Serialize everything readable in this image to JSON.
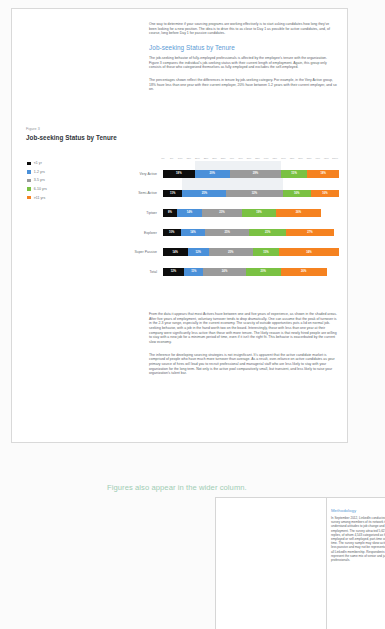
{
  "document": {
    "body_paragraphs": [
      "One way to determine if your sourcing programs are working effectively is to start asking candidates how long they've been looking for a new position. The idea is to drive this to as close to Day 1 as possible for active candidates, and, of course, long before Day 1 for passive candidates."
    ],
    "section_heading": "Job-seeking Status by Tenure",
    "section_paragraphs": [
      "The job-seeking behavior of fully-employed professionals is affected by the employee's tenure with the organization. Figure 3 compares the individual's job-seeking status with their current length of employment. Again, this group only consists of those who categorized themselves as fully employed and excludes the self-employed.",
      "The percentages shown reflect the differences in tenure by job-seeking category. For example, in the Very Active group, 18% have less than one year with their current employer, 20% have between 1-2 years with their current employer, and so on."
    ],
    "after_figure_paragraphs": [
      "From the data it appears that most Actives have between one and five years of experience, as shown in the shaded areas. After five years of employment, voluntary turnover tends to drop dramatically. One can assume that the peak of turnover is in the 2-3 year range, especially in the current economy. The scarcity of outside opportunities puts a lid on normal job-seeking behavior, with a job in the hand worth two on the board. Interestingly, those with less than one year at their company were significantly less active than those with more tenure. The likely reason is that newly hired people are willing to stay with a new job for a minimum period of time, even if it isn't the right fit. This behavior is exacerbated by the current slow economy.",
      "The inference for developing sourcing strategies is not insignificant. It's apparent that the active candidate market is comprised of people who have much more turnover than average. As a result, over-reliance on active candidates as your primary source of hires will lead you to recruit professional and managerial staff who are less likely to stay with your organization for the long term. Not only is the active pool comparatively small, but transient, and less likely to raise your organization's talent bar."
    ]
  },
  "annotation": {
    "note_text": "Figures also appear in the wider column."
  },
  "figure": {
    "figure_number": "Figure 3",
    "title": "Job-seeking Status by Tenure"
  },
  "methodology": {
    "heading": "Methodology",
    "paragraph": "In September 2012, LinkedIn conducted a survey among members of its network to better understand attitudes to job change and current employment. The survey attracted 5,627 replies, of whom 4,543 categorized as fully-employed or self-employed, part-time or full time. The survey sample may skew active and less passive and may not be representative of all LinkedIn membership. Respondents represent the same mix of senior and junior professionals."
  },
  "chart_data": {
    "type": "bar",
    "subtype": "stacked-horizontal-100",
    "title": "Job-seeking Status by Tenure",
    "xlabel": "",
    "ylabel": "",
    "xlim": [
      0,
      100
    ],
    "grid": false,
    "legend_position": "left",
    "axis_ticks": [
      "0%",
      "5%",
      "10%",
      "15%",
      "20%",
      "25%",
      "30%",
      "35%",
      "40%",
      "45%",
      "50%",
      "55%",
      "60%",
      "65%",
      "70%",
      "75%",
      "80%",
      "85%",
      "90%",
      "95%",
      "100%"
    ],
    "categories": [
      "Very Active",
      "Semi-Active",
      "Tiptoer",
      "Explorer",
      "Super Passive",
      "Total"
    ],
    "series": [
      {
        "name": "<1 yr",
        "color": "#0d0d0d",
        "values": [
          18,
          11,
          8,
          10,
          14,
          12
        ]
      },
      {
        "name": "1-2 yrs",
        "color": "#4a90d9",
        "values": [
          20,
          25,
          14,
          14,
          12,
          11
        ]
      },
      {
        "name": "3-5 yrs",
        "color": "#9a9a9a",
        "values": [
          29,
          32,
          23,
          25,
          25,
          24
        ]
      },
      {
        "name": "6-10 yrs",
        "color": "#7ac143",
        "values": [
          15,
          16,
          19,
          21,
          15,
          20
        ]
      },
      {
        "name": ">11 yrs",
        "color": "#f58220",
        "values": [
          18,
          16,
          26,
          27,
          34,
          26
        ]
      }
    ],
    "shaded_regions": [
      {
        "label": "1-5 yrs highlight",
        "from": 18,
        "to": 67,
        "rows": [
          "Very Active"
        ]
      },
      {
        "label": "1-5 yrs highlight",
        "from": 11,
        "to": 68,
        "rows": [
          "Semi-Active"
        ]
      }
    ]
  }
}
